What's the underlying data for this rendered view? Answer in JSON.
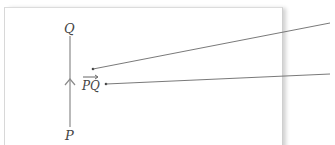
{
  "diagram": {
    "point_top_label": "Q",
    "point_bottom_label": "P",
    "vector_label": "PQ",
    "colors": {
      "segment": "#8a8a8a",
      "leader": "#6a6a6a",
      "text": "#444444",
      "frame": "#d8d8d8"
    }
  }
}
